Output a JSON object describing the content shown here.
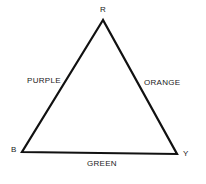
{
  "diagram": {
    "type": "color-triangle",
    "vertices": {
      "top": "R",
      "bottom_left": "B",
      "bottom_right": "Y"
    },
    "edges": {
      "left": "PURPLE",
      "right": "ORANGE",
      "bottom": "GREEN"
    },
    "line_color": "#111111"
  }
}
